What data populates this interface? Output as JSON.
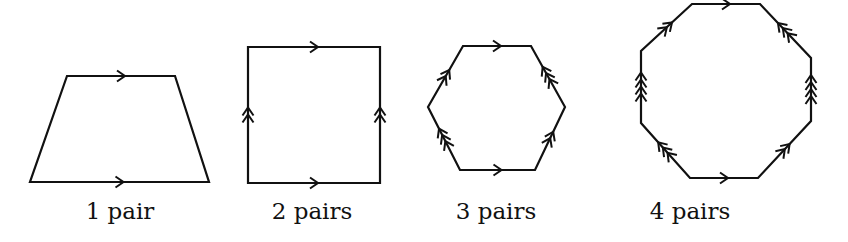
{
  "figure": {
    "stroke_color": "#111111",
    "shapes": [
      {
        "name": "trapezoid",
        "label": "1 pair",
        "label_x": 120,
        "vertices": [
          [
            67,
            76
          ],
          [
            175,
            76
          ],
          [
            209,
            182
          ],
          [
            30,
            182
          ]
        ],
        "parallel_marks": [
          {
            "from": [
              67,
              76
            ],
            "to": [
              175,
              76
            ],
            "count": 1
          },
          {
            "from": [
              30,
              182
            ],
            "to": [
              209,
              182
            ],
            "count": 1
          }
        ]
      },
      {
        "name": "square",
        "label": "2 pairs",
        "label_x": 312,
        "vertices": [
          [
            248,
            47
          ],
          [
            380,
            47
          ],
          [
            380,
            183
          ],
          [
            248,
            183
          ]
        ],
        "parallel_marks": [
          {
            "from": [
              248,
              47
            ],
            "to": [
              380,
              47
            ],
            "count": 1
          },
          {
            "from": [
              248,
              183
            ],
            "to": [
              380,
              183
            ],
            "count": 1
          },
          {
            "from": [
              248,
              183
            ],
            "to": [
              248,
              47
            ],
            "count": 2
          },
          {
            "from": [
              380,
              183
            ],
            "to": [
              380,
              47
            ],
            "count": 2
          }
        ]
      },
      {
        "name": "hexagon",
        "label": "3 pairs",
        "label_x": 496,
        "vertices": [
          [
            463,
            46
          ],
          [
            531,
            46
          ],
          [
            565,
            107
          ],
          [
            535,
            170
          ],
          [
            460,
            170
          ],
          [
            428,
            107
          ]
        ],
        "parallel_marks": [
          {
            "from": [
              463,
              46
            ],
            "to": [
              531,
              46
            ],
            "count": 1
          },
          {
            "from": [
              460,
              170
            ],
            "to": [
              535,
              170
            ],
            "count": 1
          },
          {
            "from": [
              428,
              107
            ],
            "to": [
              463,
              46
            ],
            "count": 2
          },
          {
            "from": [
              535,
              170
            ],
            "to": [
              565,
              107
            ],
            "count": 2
          },
          {
            "from": [
              565,
              107
            ],
            "to": [
              531,
              46
            ],
            "count": 3
          },
          {
            "from": [
              460,
              170
            ],
            "to": [
              428,
              107
            ],
            "count": 3
          }
        ]
      },
      {
        "name": "octagon",
        "label": "4 pairs",
        "label_x": 690,
        "vertices": [
          [
            692,
            4
          ],
          [
            760,
            4
          ],
          [
            811,
            58
          ],
          [
            811,
            121
          ],
          [
            758,
            178
          ],
          [
            690,
            178
          ],
          [
            641,
            123
          ],
          [
            641,
            51
          ]
        ],
        "parallel_marks": [
          {
            "from": [
              692,
              4
            ],
            "to": [
              760,
              4
            ],
            "count": 1
          },
          {
            "from": [
              690,
              178
            ],
            "to": [
              758,
              178
            ],
            "count": 1
          },
          {
            "from": [
              641,
              51
            ],
            "to": [
              692,
              4
            ],
            "count": 2
          },
          {
            "from": [
              758,
              178
            ],
            "to": [
              811,
              121
            ],
            "count": 2
          },
          {
            "from": [
              811,
              58
            ],
            "to": [
              760,
              4
            ],
            "count": 3
          },
          {
            "from": [
              690,
              178
            ],
            "to": [
              641,
              123
            ],
            "count": 3
          },
          {
            "from": [
              641,
              123
            ],
            "to": [
              641,
              51
            ],
            "count": 4
          },
          {
            "from": [
              811,
              121
            ],
            "to": [
              811,
              58
            ],
            "count": 4
          }
        ]
      }
    ]
  }
}
